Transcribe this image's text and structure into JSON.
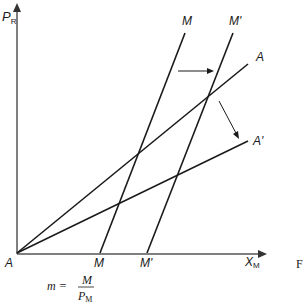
{
  "diagram": {
    "type": "economics-shift-diagram",
    "axes": {
      "y_label": "P",
      "y_label_sub": "R",
      "x_label": "X",
      "x_label_sub": "M",
      "origin_label": "A"
    },
    "lines": {
      "M_top": "M",
      "M_prime_top": "M'",
      "A_label": "A",
      "A_prime_label": "A'",
      "M_bottom": "M",
      "M_prime_bottom": "M'"
    },
    "formula": {
      "lhs": "m =",
      "numerator": "M",
      "denominator": "P",
      "denominator_sub": "M"
    },
    "cut_off_text": "F",
    "colors": {
      "line": "#1a1a1a",
      "axis": "#555555",
      "background": "#ffffff"
    }
  }
}
